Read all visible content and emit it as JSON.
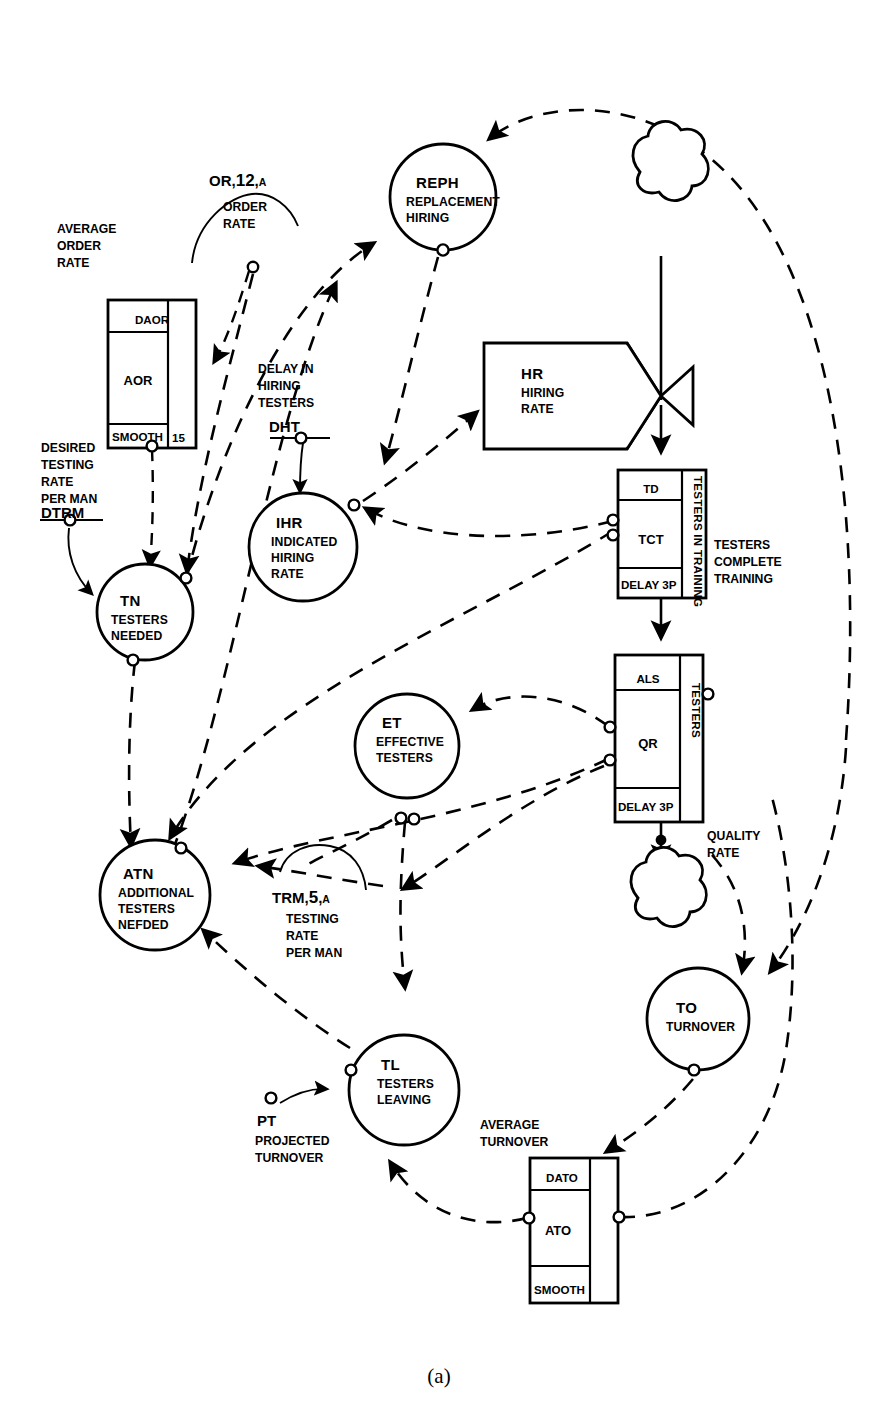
{
  "figure": {
    "caption": "(a)",
    "type": "system-dynamics-flow-diagram"
  },
  "nodes": {
    "reph": {
      "abbr": "REPH",
      "desc_lines": [
        "REPLACEMENT",
        "HIRING"
      ]
    },
    "ihr": {
      "abbr": "IHR",
      "desc_lines": [
        "INDICATED",
        "HIRING",
        "RATE"
      ]
    },
    "tn": {
      "abbr": "TN",
      "desc_lines": [
        "TESTERS",
        "NEEDED"
      ]
    },
    "et": {
      "abbr": "ET",
      "desc_lines": [
        "EFFECTIVE",
        "TESTERS"
      ]
    },
    "atn": {
      "abbr": "ATN",
      "desc_lines": [
        "ADDITIONAL",
        "TESTERS",
        "NEFDED"
      ]
    },
    "tl": {
      "abbr": "TL",
      "desc_lines": [
        "TESTERS",
        "LEAVING"
      ]
    },
    "to": {
      "abbr": "TO",
      "desc_lines": [
        "TURNOVER"
      ]
    }
  },
  "rate_box": {
    "hr": {
      "abbr": "HR",
      "desc_lines": [
        "HIRING",
        "RATE"
      ]
    }
  },
  "level_boxes": {
    "aor": {
      "title_lines": [
        "AVERAGE",
        "ORDER",
        "RATE"
      ],
      "top": "DAOR",
      "center": "AOR",
      "bottom": "SMOOTH",
      "side_value": "15"
    },
    "tct": {
      "top": "TD",
      "center": "TCT",
      "bottom": "DELAY 3P",
      "side_label": "TESTERS IN TRAINING",
      "outflow_lines": [
        "TESTERS",
        "COMPLETE",
        "TRAINING"
      ]
    },
    "qr": {
      "top": "ALS",
      "center": "QR",
      "bottom": "DELAY 3P",
      "side_label": "TESTERS",
      "outflow_lines": [
        "QUALITY",
        "RATE"
      ]
    },
    "ato": {
      "title_lines": [
        "AVERAGE",
        "TURNOVER"
      ],
      "top": "DATO",
      "center": "ATO",
      "bottom": "SMOOTH"
    }
  },
  "auxiliaries": {
    "order_rate": {
      "code": "OR",
      "number": "12",
      "class": "A",
      "desc_lines": [
        "ORDER",
        "RATE"
      ]
    },
    "dht": {
      "desc_lines": [
        "DELAY IN",
        "HIRING",
        "TESTERS"
      ],
      "code": "DHT"
    },
    "dtrm": {
      "desc_lines": [
        "DESIRED",
        "TESTING",
        "RATE",
        "PER MAN"
      ],
      "code": "DTRM"
    },
    "trm": {
      "code": "TRM",
      "number": "5",
      "class": "A",
      "desc_lines": [
        "TESTING",
        "RATE",
        "PER MAN"
      ]
    },
    "pt": {
      "code": "PT",
      "desc_lines": [
        "PROJECTED",
        "TURNOVER"
      ]
    }
  },
  "colors": {
    "ink": "#000000",
    "paper": "#ffffff"
  }
}
